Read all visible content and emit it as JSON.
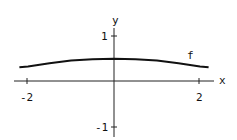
{
  "chart_data": {
    "type": "line",
    "title": "",
    "xlabel": "x",
    "ylabel": "y",
    "xlim": [
      -2.3,
      2.3
    ],
    "ylim": [
      -1.2,
      1.2
    ],
    "x_ticks": [
      -2,
      2
    ],
    "y_ticks": [
      1,
      -1
    ],
    "x_tick_labels": [
      "-2",
      "2"
    ],
    "y_tick_labels": [
      "1",
      "-1"
    ],
    "grid": false,
    "legend": null,
    "series": [
      {
        "name": "f",
        "x": [
          -2.2,
          -2.0,
          -1.5,
          -1.0,
          -0.5,
          0.0,
          0.5,
          1.0,
          1.5,
          2.0,
          2.2
        ],
        "values": [
          0.3,
          0.32,
          0.39,
          0.45,
          0.48,
          0.49,
          0.48,
          0.45,
          0.39,
          0.32,
          0.3
        ]
      }
    ],
    "annotations": [
      {
        "text": "f",
        "x": 1.75,
        "y": 0.58
      }
    ]
  },
  "labels": {
    "x_axis": "x",
    "y_axis": "y",
    "curve": "f",
    "xt_neg2": "-2",
    "xt_2": "2",
    "yt_1": "1",
    "yt_neg1": "-1"
  }
}
